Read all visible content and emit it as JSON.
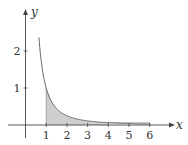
{
  "chart_data": {
    "type": "area",
    "title": "",
    "function": "y = 1/x^2",
    "xlabel": "x",
    "ylabel": "y",
    "xlim": [
      0,
      6.4
    ],
    "ylim": [
      0,
      2.5
    ],
    "x_ticks": [
      "1",
      "2",
      "3",
      "4",
      "5",
      "6"
    ],
    "y_ticks": [
      "1",
      "2"
    ],
    "curve_domain": [
      0.65,
      6
    ],
    "shaded_region": {
      "from": 1,
      "to": 4,
      "color": "#cfcfcf"
    },
    "unshaded_outline_region": {
      "from": 4,
      "to": 6
    },
    "grid": false,
    "legend": null,
    "x": [
      0.65,
      1,
      1.5,
      2,
      3,
      4,
      5,
      6
    ],
    "series": [
      {
        "name": "1/x^2",
        "values": [
          2.37,
          1.0,
          0.444,
          0.25,
          0.111,
          0.0625,
          0.04,
          0.0278
        ]
      }
    ]
  },
  "colors": {
    "axis": "#444444",
    "curve": "#555555",
    "fill": "#cfcfcf"
  }
}
